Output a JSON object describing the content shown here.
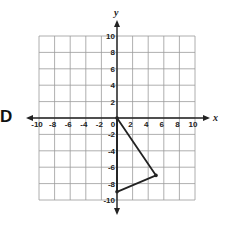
{
  "choice_label": "D",
  "chart_data": {
    "type": "scatter",
    "title": "",
    "xlabel": "x",
    "ylabel": "y",
    "xlim": [
      -10,
      10
    ],
    "ylim": [
      -10,
      10
    ],
    "grid": true,
    "grid_step": 2,
    "x_ticks": [
      "-10",
      "-8",
      "-6",
      "-4",
      "-2",
      "0",
      "2",
      "4",
      "6",
      "8",
      "10"
    ],
    "y_ticks": [
      "10",
      "8",
      "6",
      "4",
      "2",
      "-2",
      "-4",
      "-6",
      "-8",
      "-10"
    ],
    "series": [
      {
        "name": "triangle",
        "shape": "polygon",
        "points": [
          [
            0,
            0
          ],
          [
            5,
            -7
          ],
          [
            0,
            -9
          ]
        ],
        "color": "#222222"
      }
    ]
  }
}
